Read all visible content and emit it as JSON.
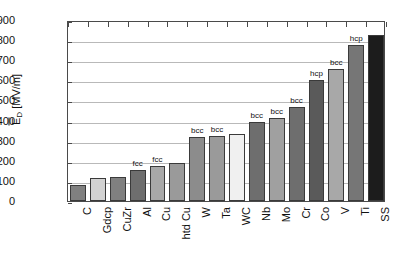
{
  "chart_data": {
    "type": "bar",
    "title": "",
    "xlabel": "",
    "ylabel": "ĒD [MV/m]",
    "ylabel_main": "E",
    "ylabel_sub": "D",
    "ylabel_unit": " [MV/m]",
    "ylim": [
      0,
      900
    ],
    "ytick_step": 100,
    "yticks": [
      "900",
      "800",
      "700",
      "600",
      "500",
      "400",
      "300",
      "200",
      "100",
      "0"
    ],
    "grid": true,
    "grid_axis": "y",
    "legend": "none",
    "categories": [
      "C",
      "Gdcp",
      "CuZr",
      "Al",
      "Cu",
      "htd Cu",
      "W",
      "Ta",
      "WC",
      "Nb",
      "Mo",
      "Cr",
      "Co",
      "V",
      "Ti",
      "SS"
    ],
    "values": [
      80,
      115,
      118,
      155,
      172,
      188,
      320,
      325,
      335,
      395,
      412,
      465,
      600,
      655,
      775,
      825
    ],
    "annotations": [
      "",
      "",
      "",
      "fcc",
      "fcc",
      "",
      "bcc",
      "bcc",
      "",
      "bcc",
      "bcc",
      "bcc",
      "hcp",
      "bcc",
      "hcp",
      ""
    ],
    "bar_colors": [
      "#808080",
      "#d2d2d2",
      "#808080",
      "#6e6e6e",
      "#a8a8a8",
      "#9a9a9a",
      "#8c8c8c",
      "#9a9a9a",
      "#f0f0f0",
      "#6e6e6e",
      "#a0a0a0",
      "#6e6e6e",
      "#5a5a5a",
      "#a8a8a8",
      "#767676",
      "#1c1c1c"
    ]
  },
  "axis": {
    "frame_color": "#4a4a4a",
    "grid_color": "#b9b9b9"
  }
}
